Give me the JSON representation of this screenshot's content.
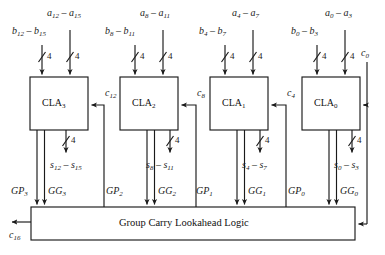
{
  "diagram": {
    "type": "16-bit carry lookahead adder block diagram",
    "blocks": [
      {
        "id": "cla3",
        "label": "CLA",
        "sub": "3",
        "a_input": "a",
        "a_range": "12 – a",
        "a_sub_lo": "12",
        "a_sub_hi": "15",
        "b_sub_lo": "12",
        "b_sub_hi": "15",
        "s_sub_lo": "12",
        "s_sub_hi": "15",
        "carry_in": "c",
        "carry_in_sub": "12",
        "gp": "GP",
        "gp_sub": "3",
        "gg": "GG",
        "gg_sub": "3",
        "bus_width": "4"
      },
      {
        "id": "cla2",
        "label": "CLA",
        "sub": "2",
        "a_sub_lo": "8",
        "a_sub_hi": "11",
        "b_sub_lo": "8",
        "b_sub_hi": "11",
        "s_sub_lo": "8",
        "s_sub_hi": "11",
        "carry_in": "c",
        "carry_in_sub": "8",
        "gp": "GP",
        "gp_sub": "2",
        "gg": "GG",
        "gg_sub": "2",
        "bus_width": "4"
      },
      {
        "id": "cla1",
        "label": "CLA",
        "sub": "1",
        "a_sub_lo": "4",
        "a_sub_hi": "7",
        "b_sub_lo": "4",
        "b_sub_hi": "7",
        "s_sub_lo": "4",
        "s_sub_hi": "7",
        "carry_in": "c",
        "carry_in_sub": "4",
        "gp": "GP",
        "gp_sub": "1",
        "gg": "GG",
        "gg_sub": "1",
        "bus_width": "4"
      },
      {
        "id": "cla0",
        "label": "CLA",
        "sub": "0",
        "a_sub_lo": "0",
        "a_sub_hi": "3",
        "b_sub_lo": "0",
        "b_sub_hi": "3",
        "s_sub_lo": "0",
        "s_sub_hi": "3",
        "carry_in": "c",
        "carry_in_sub": "0",
        "gp": "GP",
        "gp_sub": "0",
        "gg": "GG",
        "gg_sub": "0",
        "bus_width": "4"
      }
    ],
    "group_logic": {
      "label": "Group Carry Lookahead Logic"
    },
    "carry_out": {
      "symbol": "c",
      "sub": "16"
    },
    "letters": {
      "a": "a",
      "b": "b",
      "s": "s",
      "c": "c",
      "dash": "–"
    },
    "bus_width": "4",
    "colors": {
      "line": "#1a1a1a",
      "text": "#141414",
      "background": "#ffffff"
    }
  }
}
